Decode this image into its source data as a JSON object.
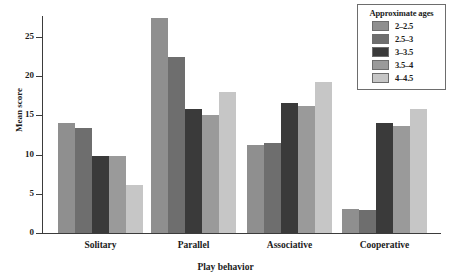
{
  "chart_data": {
    "type": "bar",
    "title": "",
    "xlabel": "Play behavior",
    "ylabel": "Mean score",
    "categories": [
      "Solitary",
      "Parallel",
      "Associative",
      "Cooperative"
    ],
    "ylim": [
      0,
      28
    ],
    "yticks": [
      0,
      5,
      10,
      15,
      20,
      25
    ],
    "grid": false,
    "legend_title": "Approximate ages",
    "legend_position": "top-right",
    "series": [
      {
        "name": "2–2.5",
        "color": "#8f8f8f",
        "values": [
          14.0,
          27.4,
          11.2,
          3.0
        ]
      },
      {
        "name": "2.5–3",
        "color": "#6e6e6e",
        "values": [
          13.4,
          22.4,
          11.5,
          2.9
        ]
      },
      {
        "name": "3–3.5",
        "color": "#3a3a3a",
        "values": [
          9.8,
          15.8,
          16.6,
          14.0
        ]
      },
      {
        "name": "3.5–4",
        "color": "#9a9a9a",
        "values": [
          9.8,
          15.0,
          16.2,
          13.6
        ]
      },
      {
        "name": "4–4.5",
        "color": "#c6c6c6",
        "values": [
          6.1,
          18.0,
          19.2,
          15.8
        ]
      }
    ]
  }
}
